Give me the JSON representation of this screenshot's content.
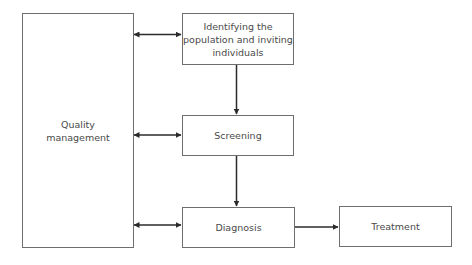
{
  "diagram": {
    "type": "flowchart",
    "nodes": [
      {
        "id": "quality",
        "label": "Quality\nmanagement",
        "lines": [
          "Quality",
          "management"
        ]
      },
      {
        "id": "identify",
        "label": "Identifying the population and inviting individuals",
        "lines": [
          "Identifying the",
          "population and inviting",
          "individuals"
        ]
      },
      {
        "id": "screening",
        "label": "Screening",
        "lines": [
          "Screening"
        ]
      },
      {
        "id": "diagnosis",
        "label": "Diagnosis",
        "lines": [
          "Diagnosis"
        ]
      },
      {
        "id": "treatment",
        "label": "Treatment",
        "lines": [
          "Treatment"
        ]
      }
    ],
    "edges": [
      {
        "from": "quality",
        "to": "identify",
        "bidirectional": true
      },
      {
        "from": "quality",
        "to": "screening",
        "bidirectional": true
      },
      {
        "from": "quality",
        "to": "diagnosis",
        "bidirectional": true
      },
      {
        "from": "identify",
        "to": "screening",
        "bidirectional": false
      },
      {
        "from": "screening",
        "to": "diagnosis",
        "bidirectional": false
      },
      {
        "from": "diagnosis",
        "to": "treatment",
        "bidirectional": false
      }
    ],
    "colors": {
      "border": "#6e6e6e",
      "arrow": "#2b2b2b",
      "text": "#4a4a4a"
    }
  }
}
